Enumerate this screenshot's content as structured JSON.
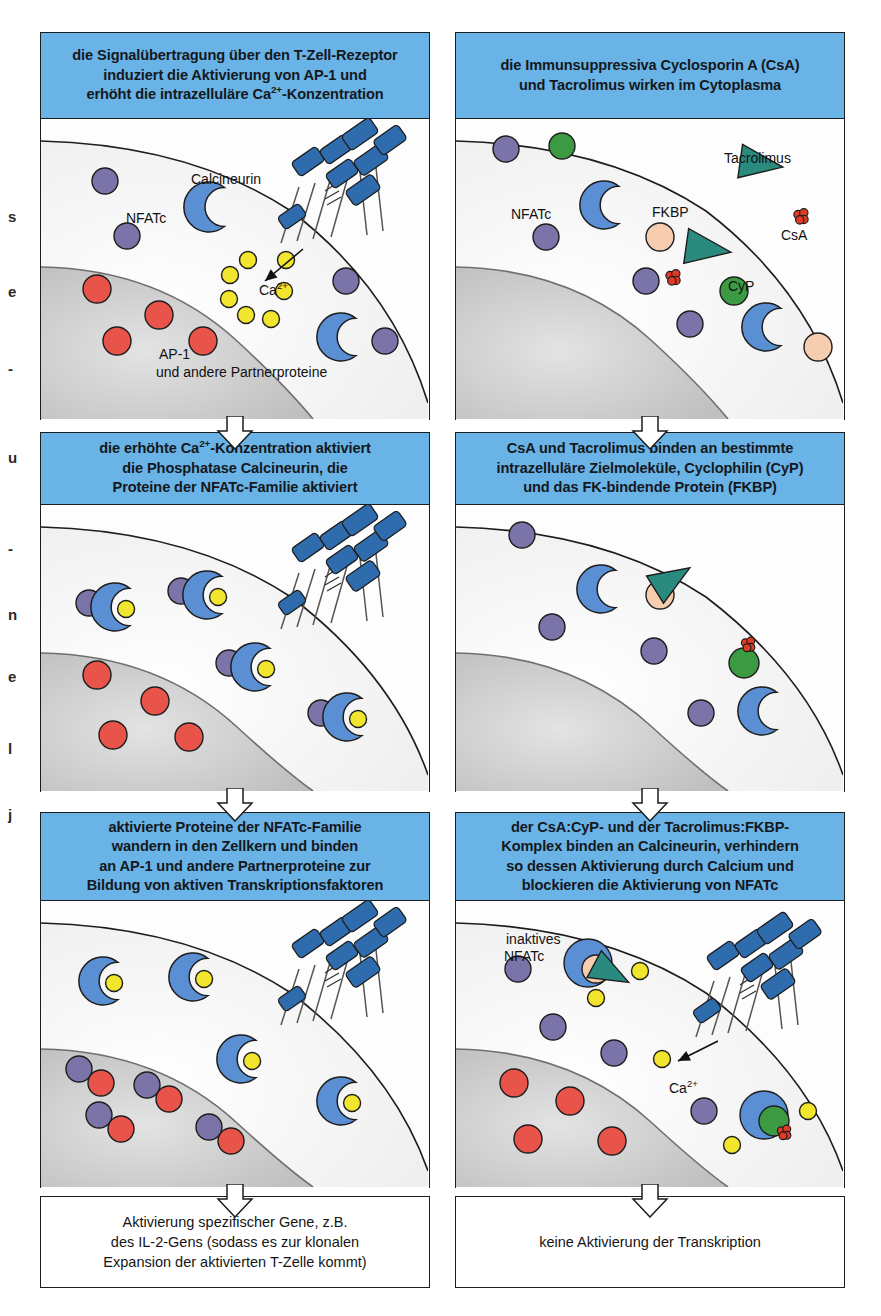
{
  "figure": {
    "columns": 2,
    "rows": 3
  },
  "edge_text": [
    {
      "char": "s",
      "y": 208
    },
    {
      "char": "e",
      "y": 283
    },
    {
      "char": "-",
      "y": 360
    },
    {
      "char": "u",
      "y": 449
    },
    {
      "char": "-",
      "y": 540
    },
    {
      "char": "n",
      "y": 606
    },
    {
      "char": "e",
      "y": 668
    },
    {
      "char": "l",
      "y": 740
    },
    {
      "char": "j",
      "y": 806
    }
  ],
  "panels": [
    {
      "id": "panel-1",
      "header": "die Signalübertragung über den T-Zell-Rezeptor induziert die Aktivierung von AP-1 und erhöht die intrazelluläre Ca2+-Konzentration",
      "header_lines": [
        "die Signalübertragung über den T-Zell-Rezeptor",
        "induziert die Aktivierung von AP-1 und",
        "erhöht die intrazelluläre Ca²⁺-Konzentration"
      ],
      "labels": [
        {
          "name": "calcineurin-label",
          "text": "Calcineurin",
          "x": 150,
          "y": 53
        },
        {
          "name": "nfatc-label",
          "text": "NFATc",
          "x": 85,
          "y": 92
        },
        {
          "name": "ap1-label",
          "text": "AP-1",
          "x": 118,
          "y": 228
        },
        {
          "name": "partner-proteins-label",
          "text": "und andere Partnerproteine",
          "x": 115,
          "y": 246
        },
        {
          "name": "calcium-label",
          "text": "Ca2+",
          "x": 218,
          "y": 164
        }
      ],
      "has_receptor": true,
      "has_calcium_arrow": true
    },
    {
      "id": "panel-2",
      "header": "die Immunsuppressiva Cyclosporin A (CsA) und Tacrolimus wirken im Cytoplasma",
      "header_lines": [
        "die Immunsuppressiva Cyclosporin A (CsA)",
        "und Tacrolimus wirken im Cytoplasma"
      ],
      "labels": [
        {
          "name": "tacrolimus-label",
          "text": "Tacrolimus",
          "x": 268,
          "y": 32
        },
        {
          "name": "nfatc-label",
          "text": "NFATc",
          "x": 55,
          "y": 88
        },
        {
          "name": "fkbp-label",
          "text": "FKBP",
          "x": 196,
          "y": 86
        },
        {
          "name": "csa-label",
          "text": "CsA",
          "x": 325,
          "y": 109
        },
        {
          "name": "cyp-label",
          "text": "CyP",
          "x": 272,
          "y": 160
        }
      ],
      "has_receptor": false,
      "has_calcium_arrow": false
    },
    {
      "id": "panel-3",
      "header": "die erhöhte Ca2+-Konzentration aktiviert die Phosphatase Calcineurin, die Proteine der NFATc-Familie aktiviert",
      "header_lines": [
        "die erhöhte Ca²⁺-Konzentration aktiviert",
        "die Phosphatase Calcineurin, die",
        "Proteine der NFATc-Familie aktiviert"
      ],
      "labels": [],
      "has_receptor": true,
      "has_calcium_arrow": false
    },
    {
      "id": "panel-4",
      "header": "CsA und Tacrolimus binden an bestimmte intrazelluläre Zielmoleküle, Cyclophilin (CyP) und das FK-bindende Protein (FKBP)",
      "header_lines": [
        "CsA und Tacrolimus binden an bestimmte",
        "intrazelluläre Zielmoleküle, Cyclophilin (CyP)",
        "und das FK-bindende Protein (FKBP)"
      ],
      "labels": [],
      "has_receptor": false,
      "has_calcium_arrow": false
    },
    {
      "id": "panel-5",
      "header": "aktivierte Proteine der NFATc-Familie wandern in den Zellkern und binden an AP-1 und andere Partnerproteine zur Bildung von aktiven Transkriptionsfaktoren",
      "header_lines": [
        "aktivierte Proteine der NFATc-Familie",
        "wandern in den Zellkern und binden",
        "an AP-1 und andere Partnerproteine zur",
        "Bildung von aktiven Transkriptionsfaktoren"
      ],
      "labels": [],
      "has_receptor": true,
      "has_calcium_arrow": false
    },
    {
      "id": "panel-6",
      "header": "der CsA:CyP- und der Tacrolimus:FKBP-Komplex binden an Calcineurin, verhindern so dessen Aktivierung durch Calcium und blockieren die Aktivierung von NFATc",
      "header_lines": [
        "der CsA:CyP- und der Tacrolimus:FKBP-",
        "Komplex binden an Calcineurin, verhindern",
        "so dessen Aktivierung durch Calcium und",
        "blockieren die Aktivierung von NFATc"
      ],
      "labels": [
        {
          "name": "inactive-nfatc-label-1",
          "text": "inaktives",
          "x": 50,
          "y": 31
        },
        {
          "name": "inactive-nfatc-label-2",
          "text": "NFATc",
          "x": 48,
          "y": 48
        },
        {
          "name": "calcium-label",
          "text": "Ca2+",
          "x": 213,
          "y": 180
        }
      ],
      "has_receptor": true,
      "has_calcium_arrow": true
    }
  ],
  "conclusions": [
    {
      "id": "conclusion-left",
      "lines": [
        "Aktivierung spezifischer Gene, z.B.",
        "des IL-2-Gens (sodass es zur klonalen",
        "Expansion der aktivierten T-Zelle kommt)"
      ]
    },
    {
      "id": "conclusion-right",
      "lines": [
        "keine Aktivierung der Transkription"
      ]
    }
  ],
  "legend_molecules": [
    {
      "name": "NFATc",
      "shape": "circle",
      "color": "#7b74a8"
    },
    {
      "name": "AP-1 / Partnerproteine",
      "shape": "circle",
      "color": "#e8544a"
    },
    {
      "name": "Calcineurin",
      "shape": "crescent",
      "color": "#5b8fd4"
    },
    {
      "name": "Ca2+",
      "shape": "small-circle",
      "color": "#f2e52e"
    },
    {
      "name": "CyP",
      "shape": "circle",
      "color": "#3c9a43"
    },
    {
      "name": "FKBP",
      "shape": "circle",
      "color": "#f6cdae"
    },
    {
      "name": "Tacrolimus",
      "shape": "triangle",
      "color": "#2b8a7e"
    },
    {
      "name": "CsA",
      "shape": "double-circle",
      "color": "#e23b25"
    },
    {
      "name": "T-Zell-Rezeptor",
      "shape": "blue-blocks",
      "color": "#2f6cad"
    }
  ],
  "colors": {
    "header_blue": "#69b3e7",
    "nucleus_gray": "#c9c9c9",
    "cytoplasm": "#f4f4f4",
    "outline": "#1d1d1d"
  }
}
